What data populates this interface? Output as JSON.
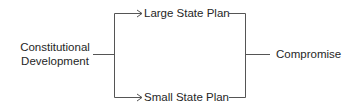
{
  "diagram": {
    "type": "flow",
    "nodes": {
      "start": {
        "line1": "Constitutional",
        "line2": "Development"
      },
      "branch_top": "Large State Plan",
      "branch_bottom": "Small State Plan",
      "end": "Compromise"
    },
    "edges": [
      {
        "from": "Constitutional Development",
        "to": "Large State Plan",
        "arrow": true
      },
      {
        "from": "Constitutional Development",
        "to": "Small State Plan",
        "arrow": true
      },
      {
        "from": "Large State Plan",
        "to": "Compromise",
        "arrow": false
      },
      {
        "from": "Small State Plan",
        "to": "Compromise",
        "arrow": false
      }
    ],
    "line_color": "#555555"
  }
}
